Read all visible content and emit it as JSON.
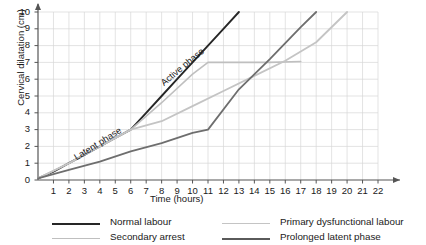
{
  "chart_data": {
    "type": "line",
    "title": "",
    "xlabel": "Time (hours)",
    "ylabel": "Cervical dilatation (cm)",
    "xlim": [
      0,
      22
    ],
    "ylim": [
      0,
      10
    ],
    "grid": true,
    "xticks": [
      1,
      2,
      3,
      4,
      5,
      6,
      7,
      8,
      9,
      10,
      11,
      12,
      13,
      14,
      15,
      16,
      17,
      18,
      19,
      20,
      21,
      22
    ],
    "yticks": [
      0,
      1,
      2,
      3,
      4,
      5,
      6,
      7,
      8,
      9,
      10
    ],
    "legend_position": "bottom",
    "annotations": [
      {
        "text": "Latent phase",
        "x": 2.4,
        "y": 1.6,
        "rotation": -32
      },
      {
        "text": "Active phase",
        "x": 8.0,
        "y": 6.0,
        "rotation": -40
      }
    ],
    "series": [
      {
        "name": "Normal labour",
        "color": "#262626",
        "width": 1.9,
        "points": [
          [
            0,
            0.1
          ],
          [
            1,
            0.5
          ],
          [
            2,
            1.0
          ],
          [
            3,
            1.5
          ],
          [
            4,
            2.0
          ],
          [
            5,
            2.5
          ],
          [
            6,
            3.0
          ],
          [
            7,
            4.0
          ],
          [
            8,
            5.0
          ],
          [
            9,
            6.0
          ],
          [
            10,
            7.0
          ],
          [
            11,
            8.0
          ],
          [
            12,
            9.0
          ],
          [
            13,
            10.0
          ]
        ]
      },
      {
        "name": "Secondary arrest",
        "color": "#bfbfbf",
        "width": 1.6,
        "points": [
          [
            0,
            0.1
          ],
          [
            2,
            1.0
          ],
          [
            4,
            2.0
          ],
          [
            6,
            3.0
          ],
          [
            8,
            4.6
          ],
          [
            10,
            6.3
          ],
          [
            11,
            7.0
          ],
          [
            13,
            7.0
          ],
          [
            15,
            7.0
          ],
          [
            17,
            7.05
          ]
        ]
      },
      {
        "name": "Primary dysfunctional labour",
        "color": "#c4c4c4",
        "width": 1.8,
        "points": [
          [
            0,
            0.1
          ],
          [
            2,
            1.0
          ],
          [
            4,
            2.0
          ],
          [
            6,
            3.0
          ],
          [
            8,
            3.5
          ],
          [
            10,
            4.4
          ],
          [
            12,
            5.3
          ],
          [
            14,
            6.2
          ],
          [
            16,
            7.1
          ],
          [
            18,
            8.2
          ],
          [
            20,
            10.0
          ]
        ]
      },
      {
        "name": "Prolonged latent phase",
        "color": "#6e6e6e",
        "width": 1.8,
        "points": [
          [
            0,
            0.1
          ],
          [
            2,
            0.6
          ],
          [
            4,
            1.1
          ],
          [
            6,
            1.7
          ],
          [
            8,
            2.2
          ],
          [
            10,
            2.8
          ],
          [
            11,
            3.0
          ],
          [
            13,
            5.4
          ],
          [
            15,
            7.2
          ],
          [
            17,
            9.1
          ],
          [
            18,
            10.0
          ]
        ]
      }
    ]
  },
  "legend": {
    "items": [
      {
        "label": "Normal labour",
        "color": "#262626",
        "col": 0,
        "row": 0
      },
      {
        "label": "Secondary arrest",
        "color": "#bfbfbf",
        "col": 0,
        "row": 1
      },
      {
        "label": "Primary dysfunctional labour",
        "color": "#c4c4c4",
        "col": 1,
        "row": 0
      },
      {
        "label": "Prolonged latent phase",
        "color": "#5a5a5a",
        "col": 1,
        "row": 1
      }
    ]
  },
  "icons": {
    "x_axis_arrow": "arrow-right-icon",
    "y_axis_arrow": "arrow-up-icon"
  }
}
